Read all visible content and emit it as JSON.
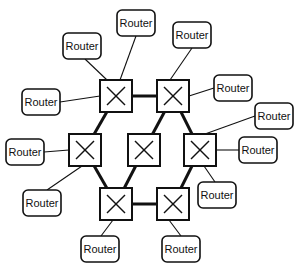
{
  "diagram": {
    "type": "network-topology",
    "colors": {
      "stroke": "#111111",
      "background": "#ffffff"
    },
    "switches": [
      {
        "id": "s1",
        "x": 100,
        "y": 80,
        "size": 32
      },
      {
        "id": "s2",
        "x": 157,
        "y": 80,
        "size": 32
      },
      {
        "id": "s3",
        "x": 69,
        "y": 134,
        "size": 32
      },
      {
        "id": "s4",
        "x": 128,
        "y": 134,
        "size": 32
      },
      {
        "id": "s5",
        "x": 184,
        "y": 134,
        "size": 32
      },
      {
        "id": "s6",
        "x": 100,
        "y": 188,
        "size": 32
      },
      {
        "id": "s7",
        "x": 157,
        "y": 188,
        "size": 32
      }
    ],
    "trunk_links": [
      [
        "s1",
        "s2"
      ],
      [
        "s1",
        "s3"
      ],
      [
        "s2",
        "s4"
      ],
      [
        "s2",
        "s5"
      ],
      [
        "s3",
        "s6"
      ],
      [
        "s4",
        "s6"
      ],
      [
        "s5",
        "s7"
      ],
      [
        "s6",
        "s7"
      ]
    ],
    "routers": [
      {
        "id": "r1",
        "label": "Router",
        "x": 63,
        "y": 33,
        "w": 38,
        "h": 26,
        "switch": "s1"
      },
      {
        "id": "r2",
        "label": "Router",
        "x": 117,
        "y": 10,
        "w": 38,
        "h": 26,
        "switch": "s1"
      },
      {
        "id": "r3",
        "label": "Router",
        "x": 22,
        "y": 89,
        "w": 38,
        "h": 26,
        "switch": "s1"
      },
      {
        "id": "r4",
        "label": "Router",
        "x": 173,
        "y": 22,
        "w": 38,
        "h": 26,
        "switch": "s2"
      },
      {
        "id": "r5",
        "label": "Router",
        "x": 214,
        "y": 75,
        "w": 38,
        "h": 26,
        "switch": "s2"
      },
      {
        "id": "r6",
        "label": "Router",
        "x": 255,
        "y": 103,
        "w": 38,
        "h": 26,
        "switch": "s5"
      },
      {
        "id": "r7",
        "label": "Router",
        "x": 6,
        "y": 139,
        "w": 38,
        "h": 26,
        "switch": "s3"
      },
      {
        "id": "r8",
        "label": "Router",
        "x": 23,
        "y": 190,
        "w": 38,
        "h": 26,
        "switch": "s3"
      },
      {
        "id": "r9",
        "label": "Router",
        "x": 239,
        "y": 137,
        "w": 38,
        "h": 26,
        "switch": "s5"
      },
      {
        "id": "r10",
        "label": "Router",
        "x": 198,
        "y": 182,
        "w": 38,
        "h": 26,
        "switch": "s5"
      },
      {
        "id": "r11",
        "label": "Router",
        "x": 81,
        "y": 236,
        "w": 38,
        "h": 26,
        "switch": "s6"
      },
      {
        "id": "r12",
        "label": "Router",
        "x": 162,
        "y": 236,
        "w": 38,
        "h": 26,
        "switch": "s7"
      }
    ],
    "router_links": [
      {
        "router": "r1",
        "from": [
          85,
          59
        ],
        "to": [
          107,
          80
        ]
      },
      {
        "router": "r2",
        "from": [
          136,
          36
        ],
        "to": [
          120,
          80
        ]
      },
      {
        "router": "r3",
        "from": [
          60,
          102
        ],
        "to": [
          100,
          96
        ]
      },
      {
        "router": "r4",
        "from": [
          192,
          48
        ],
        "to": [
          170,
          80
        ]
      },
      {
        "router": "r5",
        "from": [
          214,
          88
        ],
        "to": [
          189,
          96
        ]
      },
      {
        "router": "r6",
        "from": [
          255,
          116
        ],
        "to": [
          205,
          134
        ]
      },
      {
        "router": "r7",
        "from": [
          44,
          152
        ],
        "to": [
          69,
          150
        ]
      },
      {
        "router": "r8",
        "from": [
          47,
          190
        ],
        "to": [
          82,
          166
        ]
      },
      {
        "router": "r9",
        "from": [
          239,
          150
        ],
        "to": [
          216,
          150
        ]
      },
      {
        "router": "r10",
        "from": [
          215,
          182
        ],
        "to": [
          204,
          166
        ]
      },
      {
        "router": "r11",
        "from": [
          101,
          236
        ],
        "to": [
          113,
          220
        ]
      },
      {
        "router": "r12",
        "from": [
          181,
          236
        ],
        "to": [
          169,
          220
        ]
      }
    ]
  }
}
